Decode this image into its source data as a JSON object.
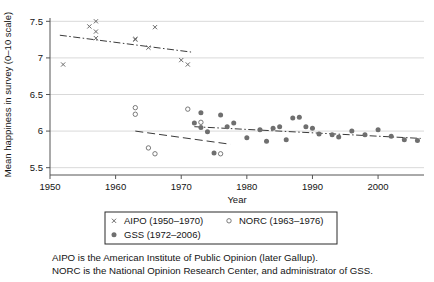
{
  "chart_data": {
    "type": "scatter",
    "title": "",
    "xlabel": "Year",
    "ylabel": "Mean happiness in survey (0–10 scale)",
    "xlim": [
      1950,
      2007
    ],
    "ylim": [
      5.4,
      7.6
    ],
    "xticks": [
      "1950",
      "1960",
      "1970",
      "1980",
      "1990",
      "2000"
    ],
    "xtick_values": [
      1950,
      1960,
      1970,
      1980,
      1990,
      2000
    ],
    "yticks": [
      "7.5",
      "7",
      "6.5",
      "6",
      "5.5"
    ],
    "ytick_values": [
      7.5,
      7.0,
      6.5,
      6.0,
      5.5
    ],
    "grid": "horizontal",
    "legend_position": "below-axes",
    "series": [
      {
        "name": "AIPO (1950–1970)",
        "marker": "cross",
        "x": [
          1952,
          1956,
          1957,
          1957,
          1957,
          1963,
          1963,
          1965,
          1966,
          1970,
          1971
        ],
        "y": [
          6.91,
          7.43,
          7.5,
          7.36,
          7.27,
          7.25,
          7.26,
          7.14,
          7.42,
          6.97,
          6.91
        ]
      },
      {
        "name": "NORC (1963–1976)",
        "marker": "open-circle",
        "x": [
          1963,
          1963,
          1965,
          1966,
          1971,
          1973,
          1976
        ],
        "y": [
          6.32,
          6.23,
          5.77,
          5.69,
          6.3,
          6.12,
          5.69
        ]
      },
      {
        "name": "GSS (1972–2006)",
        "marker": "filled-circle",
        "x": [
          1972,
          1973,
          1973,
          1974,
          1975,
          1976,
          1977,
          1978,
          1980,
          1982,
          1983,
          1984,
          1985,
          1986,
          1987,
          1988,
          1989,
          1990,
          1991,
          1993,
          1994,
          1996,
          1998,
          2000,
          2002,
          2004,
          2006
        ],
        "y": [
          6.11,
          6.25,
          6.05,
          5.99,
          5.7,
          6.22,
          6.06,
          6.11,
          5.91,
          6.02,
          5.86,
          6.04,
          6.06,
          5.88,
          6.18,
          6.19,
          6.06,
          6.04,
          5.96,
          5.95,
          5.92,
          6.0,
          5.95,
          6.02,
          5.93,
          5.88,
          5.87
        ]
      }
    ],
    "trendlines": [
      {
        "name": "aipo-fit",
        "x": [
          1951.5,
          1971.5
        ],
        "y": [
          7.31,
          7.08
        ],
        "style": "dash-dot"
      },
      {
        "name": "norc-fit",
        "x": [
          1963.0,
          1977.5
        ],
        "y": [
          6.0,
          5.82
        ],
        "style": "dashed"
      },
      {
        "name": "gss-fit",
        "x": [
          1972.0,
          2006.5
        ],
        "y": [
          6.06,
          5.9
        ],
        "style": "dash-dot"
      }
    ]
  },
  "legend": {
    "entries": [
      {
        "label": "AIPO (1950–1970)",
        "marker": "cross"
      },
      {
        "label": "NORC (1963–1976)",
        "marker": "open-circle"
      },
      {
        "label": "GSS (1972–2006)",
        "marker": "filled-circle"
      }
    ]
  },
  "footnotes": {
    "line1": "AIPO is the American Institute of Public Opinion (later Gallup).",
    "line2": "NORC is the National Opinion Research Center, and administrator of GSS."
  },
  "colors": {
    "marker": "#6f6f6f",
    "grid": "#d9d9d9",
    "axis": "#555555",
    "text": "#141414"
  }
}
